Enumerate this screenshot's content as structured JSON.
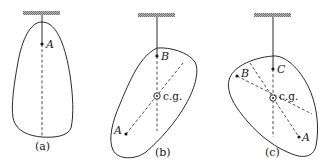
{
  "figure": {
    "panels": [
      {
        "id": "a",
        "caption": "(a)",
        "points": [
          {
            "label": "A"
          }
        ]
      },
      {
        "id": "b",
        "caption": "(b)",
        "points": [
          {
            "label": "B"
          },
          {
            "label": "A"
          }
        ],
        "cg_label": "c.g."
      },
      {
        "id": "c",
        "caption": "(c)",
        "points": [
          {
            "label": "C"
          },
          {
            "label": "B"
          },
          {
            "label": "A"
          }
        ],
        "cg_label": "c.g."
      }
    ],
    "colors": {
      "ink": "#2a2a2a",
      "hatch": "#8a8a8a",
      "background": "#ffffff"
    }
  }
}
